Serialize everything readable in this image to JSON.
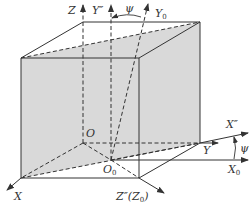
{
  "diagram": {
    "type": "coordinate-frame-rotation",
    "colors": {
      "line": "#333333",
      "face_fill": "#d9d9d9",
      "background": "#ffffff"
    },
    "labels": {
      "z": "Z",
      "y_double_prime": "Y″",
      "psi_top": "ψ",
      "y0_main": "Y",
      "y0_sub": "0",
      "o": "O",
      "o0_main": "O",
      "o0_sub": "0",
      "x": "X",
      "z_double_prime": "Z″(Z",
      "z_double_prime_sub": "0",
      "z_double_prime_close": ")",
      "y": "Y",
      "x_double_prime": "X″",
      "psi_right": "ψ",
      "x0_main": "X",
      "x0_sub": "0"
    },
    "axes": [
      {
        "name": "Z",
        "from": "O",
        "direction": "up",
        "style": "dashed"
      },
      {
        "name": "Y''",
        "from": "O0",
        "direction": "up",
        "style": "dashed"
      },
      {
        "name": "Y0",
        "from": "O0",
        "direction": "up-right",
        "style": "dashed"
      },
      {
        "name": "X",
        "from": "O",
        "direction": "down-left",
        "style": "dashed"
      },
      {
        "name": "Z''(Z0)",
        "from": "O0",
        "direction": "down-right",
        "style": "dashed"
      },
      {
        "name": "Y",
        "from": "O",
        "direction": "right",
        "style": "dashed"
      },
      {
        "name": "X''",
        "from": "O0",
        "direction": "right-up",
        "style": "solid"
      },
      {
        "name": "X0",
        "from": "O0",
        "direction": "right",
        "style": "solid"
      }
    ],
    "angles": [
      {
        "name": "psi",
        "between": [
          "Y''",
          "Y0"
        ]
      },
      {
        "name": "psi",
        "between": [
          "X0",
          "X''"
        ]
      }
    ]
  }
}
